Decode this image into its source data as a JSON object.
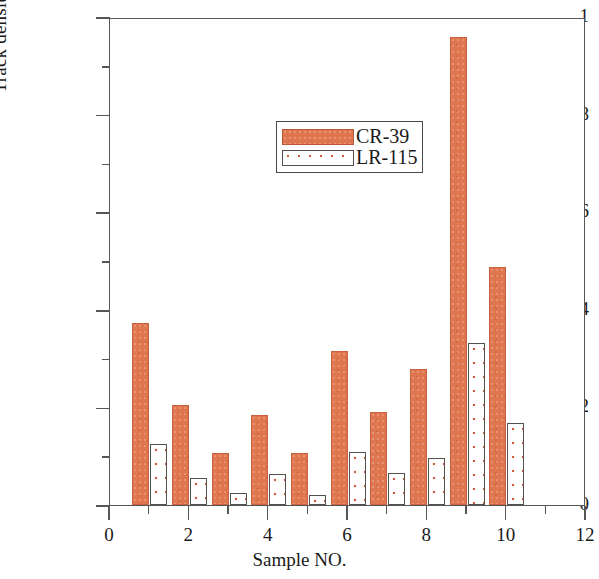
{
  "chart_data": {
    "type": "bar",
    "title": "",
    "xlabel": "Sample NO.",
    "ylabel": "Track density/(cm²· g · sec)",
    "ylabel_parts": {
      "prefix": "Track density/(cm",
      "superscript": "2",
      "suffix": "· g · sec)"
    },
    "x": [
      1,
      2,
      3,
      4,
      5,
      6,
      7,
      8,
      9,
      10
    ],
    "categories": [
      "1",
      "2",
      "3",
      "4",
      "5",
      "6",
      "7",
      "8",
      "9",
      "10"
    ],
    "series": [
      {
        "name": "CR-39",
        "color": "#e0764f",
        "values": [
          0.373,
          0.204,
          0.107,
          0.185,
          0.106,
          0.315,
          0.19,
          0.279,
          0.959,
          0.488
        ]
      },
      {
        "name": "LR-115",
        "color": "#ffffff",
        "pattern_color": "#d2593a",
        "values": [
          0.126,
          0.056,
          0.025,
          0.063,
          0.021,
          0.108,
          0.065,
          0.096,
          0.331,
          0.168
        ]
      }
    ],
    "xlim": [
      0,
      12
    ],
    "ylim": [
      0,
      1
    ],
    "xticks": [
      0,
      2,
      4,
      6,
      8,
      10,
      12
    ],
    "xtick_labels": [
      "0",
      "2",
      "4",
      "6",
      "8",
      "10",
      "12"
    ],
    "xticks_minor": [
      1,
      3,
      5,
      7,
      9,
      11
    ],
    "yticks": [
      0,
      0.2,
      0.4,
      0.6,
      0.8,
      1
    ],
    "ytick_labels": [
      "0",
      "0.2",
      "0.4",
      "0.6",
      "0.8",
      "1"
    ],
    "yticks_minor": [
      0.1,
      0.3,
      0.5,
      0.7,
      0.9
    ],
    "grid": false,
    "legend_position": "upper-left-inset",
    "legend_entries": [
      "CR-39",
      "LR-115"
    ],
    "frame_color": "#565656",
    "background": "#ffffff"
  }
}
